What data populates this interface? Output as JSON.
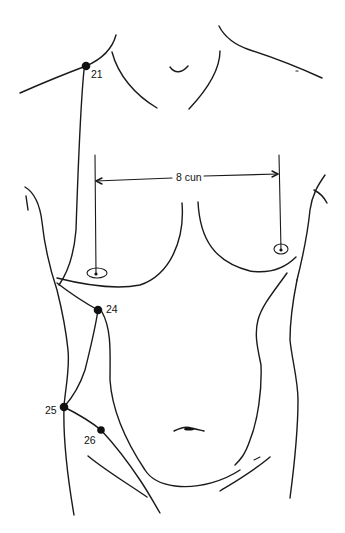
{
  "figure": {
    "stroke_color": "#1a1a1a",
    "background": "#ffffff"
  },
  "points": [
    {
      "id": "21",
      "label": "21",
      "x": 86,
      "y": 66
    },
    {
      "id": "24",
      "label": "24",
      "x": 98,
      "y": 310
    },
    {
      "id": "25",
      "label": "25",
      "x": 64,
      "y": 407
    },
    {
      "id": "26",
      "label": "26",
      "x": 101,
      "y": 430
    }
  ],
  "measurement": {
    "label": "8 cun",
    "from_x": 95,
    "to_x": 279,
    "y": 177
  }
}
